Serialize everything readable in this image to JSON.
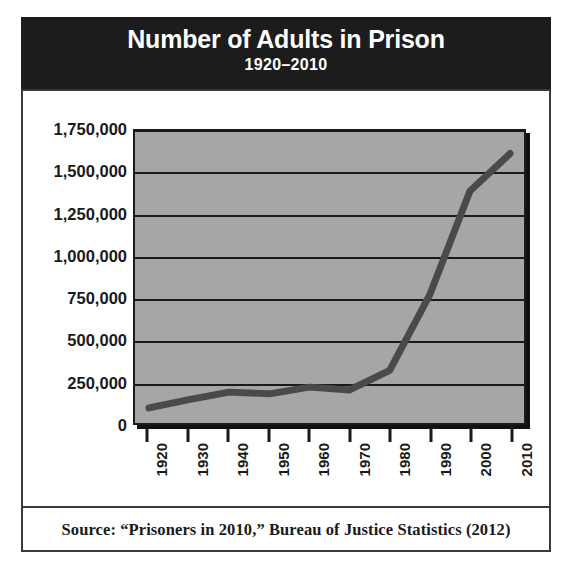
{
  "title": {
    "main": "Number of Adults in Prison",
    "subtitle": "1920–2010"
  },
  "source": {
    "text": "Source: “Prisoners in 2010,” Bureau of Justice Statistics (2012)"
  },
  "colors": {
    "title_band_background": "#1c1c1c",
    "title_text": "#ffffff",
    "plot_background": "#a6a6a6",
    "gridline": "#1a1a1a",
    "series_line": "#4a4a4a",
    "axis_text": "#1a1a1a",
    "frame_border": "#3a3a3a",
    "page_background": "#ffffff"
  },
  "chart_data": {
    "type": "line",
    "title": "Number of Adults in Prison",
    "subtitle": "1920–2010",
    "xlabel": "",
    "ylabel": "",
    "grid": true,
    "legend": "none",
    "xlim": [
      1920,
      2010
    ],
    "ylim": [
      0,
      1750000
    ],
    "ytick_labels": [
      "1,750,000",
      "1,500,000",
      "1,250,000",
      "1,000,000",
      "750,000",
      "500,000",
      "250,000",
      "0"
    ],
    "ytick_values": [
      1750000,
      1500000,
      1250000,
      1000000,
      750000,
      500000,
      250000,
      0
    ],
    "xtick_labels": [
      "1920",
      "1930",
      "1940",
      "1950",
      "1960",
      "1970",
      "1980",
      "1990",
      "2000",
      "2010"
    ],
    "x": [
      1920,
      1930,
      1940,
      1950,
      1960,
      1970,
      1980,
      1990,
      2000,
      2010
    ],
    "series": [
      {
        "name": "Adults in prison",
        "values": [
          90000,
          140000,
          185000,
          175000,
          215000,
          198000,
          315000,
          770000,
          1390000,
          1615000
        ]
      }
    ]
  }
}
